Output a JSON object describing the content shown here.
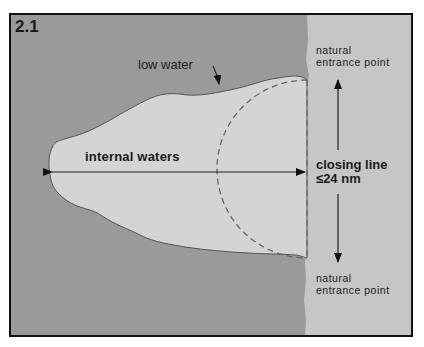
{
  "figure": {
    "number": "2.1",
    "labels": {
      "low_water": "low water",
      "internal_waters": "internal waters",
      "natural_entrance_point_top": "natural entrance point",
      "natural_entrance_point_bottom": "natural entrance point",
      "closing_line": "closing line",
      "closing_line_limit": "≤24 nm"
    },
    "colors": {
      "land": "#9a9a9a",
      "water_bay": "#d4d4d4",
      "sea_right": "#c6c6c6",
      "frame": "#111111",
      "text": "#1a1a1a"
    }
  }
}
